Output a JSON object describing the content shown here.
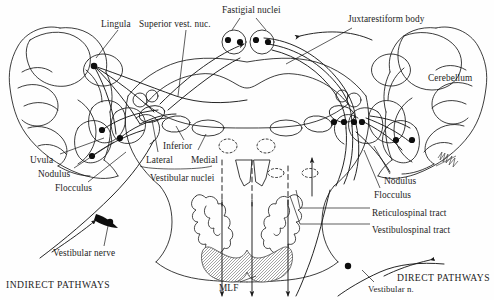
{
  "figure": {
    "title_visible": false,
    "background_color": "#fefefe",
    "ink_color": "#1a1a1a"
  },
  "labels": {
    "lingula": {
      "text": "Lingula",
      "x": 101,
      "y": 20
    },
    "superior_vest_nuc": {
      "text": "Superior vest. nuc.",
      "x": 139,
      "y": 20
    },
    "fastigial_nuclei": {
      "text": "Fastigial nuclei",
      "x": 222,
      "y": 6
    },
    "juxtarestiform_body": {
      "text": "Juxtarestiform body",
      "x": 348,
      "y": 15
    },
    "cerebellum": {
      "text": "Cerebellum",
      "x": 428,
      "y": 74
    },
    "inferior": {
      "text": "Inferior",
      "x": 163,
      "y": 142
    },
    "lateral": {
      "text": "Lateral",
      "x": 146,
      "y": 156
    },
    "medial": {
      "text": "Medial",
      "x": 191,
      "y": 156
    },
    "vestibular_nuclei": {
      "text": "Vestibular nuclei",
      "x": 150,
      "y": 174
    },
    "uvula": {
      "text": "Uvula",
      "x": 30,
      "y": 156
    },
    "nodulus_left": {
      "text": "Nodulus",
      "x": 38,
      "y": 170
    },
    "flocculus_left": {
      "text": "Flocculus",
      "x": 55,
      "y": 184
    },
    "vestibular_nerve": {
      "text": "Vestibular nerve",
      "x": 53,
      "y": 249
    },
    "indirect_pathways": {
      "text": "INDIRECT PATHWAYS",
      "x": 6,
      "y": 280
    },
    "mlf": {
      "text": "MLF",
      "x": 219,
      "y": 284
    },
    "nodulus_right": {
      "text": "Nodulus",
      "x": 384,
      "y": 177
    },
    "flocculus_right": {
      "text": "Flocculus",
      "x": 374,
      "y": 191
    },
    "reticulospinal_tract": {
      "text": "Reticulospinal tract",
      "x": 372,
      "y": 209
    },
    "vestibulospinal_tract": {
      "text": "Vestibulospinal tract",
      "x": 372,
      "y": 226
    },
    "vestibular_n_right": {
      "text": "Vestibular n.",
      "x": 368,
      "y": 285
    },
    "direct_pathways": {
      "text": "DIRECT PATHWAYS",
      "x": 397,
      "y": 273
    }
  },
  "structures": {
    "cerebellum_left": "left cerebellar hemisphere with foliated lobes",
    "cerebellum_right": "right cerebellar hemisphere with foliated lobes",
    "fourth_ventricle": "central rhomboid cavity of the brainstem",
    "fastigial_nuclei": "paired circular nuclei at top midline, 4 neuron somata",
    "vestibular_nuclei_group": "superior, lateral, medial and inferior vestibular nuclei",
    "inferior_olivary_nuclei": "paired wavy convoluted outlines in medulla",
    "pyramids": "hatched bilobed shaded mass at ventral midline",
    "mlf_tracts": "dashed descending midline fibers",
    "descending_tracts": "solid descending arrows (reticulospinal, vestibulospinal)",
    "artist_signature": "hatched scribble mark at lower right of cerebellum"
  }
}
